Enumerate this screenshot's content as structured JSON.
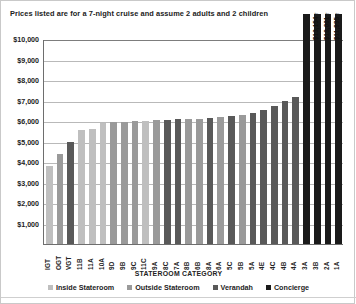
{
  "note": "Prices listed are for a 7-night cruise and assume 2 adults and 2 children",
  "axis": {
    "x_title": "STATEROOM CATEGORY",
    "y_ticks": [
      "$0",
      "$1,000",
      "$2,000",
      "$3,000",
      "$4,000",
      "$5,000",
      "$6,000",
      "$7,000",
      "$8,000",
      "$9,000",
      "$10,000"
    ]
  },
  "legend": {
    "items": [
      {
        "label": "Inside Stateroom",
        "color": "#bfbfbf"
      },
      {
        "label": "Outside Stateroom",
        "color": "#9a9a9a"
      },
      {
        "label": "Verandah",
        "color": "#595959"
      },
      {
        "label": "Concierge",
        "color": "#1a1a1a"
      }
    ]
  },
  "chart_data": {
    "type": "bar",
    "title": "",
    "subtitle": "Prices listed are for a 7-night cruise and assume 2 adults and 2 children",
    "xlabel": "STATEROOM CATEGORY",
    "ylabel": "",
    "ylim": [
      0,
      10000
    ],
    "ytick_step": 1000,
    "grid": true,
    "legend_position": "bottom",
    "categories": [
      "IGT",
      "OGT",
      "VGT",
      "11B",
      "11A",
      "10A",
      "9D",
      "9B",
      "9C",
      "11C",
      "9A",
      "8C",
      "7A",
      "8B",
      "6B",
      "8A",
      "6A",
      "5C",
      "5B",
      "5A",
      "4E",
      "4C",
      "4B",
      "4A",
      "3A",
      "3B",
      "2A",
      "1A"
    ],
    "values": [
      3800,
      4400,
      5000,
      5550,
      5600,
      5900,
      5950,
      5950,
      5980,
      6000,
      6050,
      6060,
      6080,
      6100,
      6120,
      6150,
      6200,
      6250,
      6300,
      6400,
      6550,
      6750,
      7000,
      7150,
      10000,
      10000,
      10000,
      10000
    ],
    "series_group": [
      "Inside Stateroom",
      "Outside Stateroom",
      "Verandah",
      "Inside Stateroom",
      "Inside Stateroom",
      "Inside Stateroom",
      "Outside Stateroom",
      "Outside Stateroom",
      "Outside Stateroom",
      "Inside Stateroom",
      "Outside Stateroom",
      "Verandah",
      "Verandah",
      "Outside Stateroom",
      "Outside Stateroom",
      "Verandah",
      "Outside Stateroom",
      "Verandah",
      "Outside Stateroom",
      "Verandah",
      "Verandah",
      "Verandah",
      "Verandah",
      "Verandah",
      "Concierge",
      "Concierge",
      "Concierge",
      "Concierge"
    ],
    "overflow_labels": [
      {
        "category": "3B",
        "text": "$13,154"
      },
      {
        "category": "2A",
        "text": "$18,001"
      },
      {
        "category": "1A",
        "text": "$11,995"
      }
    ]
  }
}
